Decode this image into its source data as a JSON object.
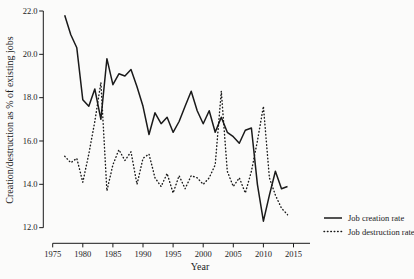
{
  "figure": {
    "background": "#fbfbfa",
    "line_color": "#1a1a1a"
  },
  "chart_data": {
    "type": "line",
    "title": "",
    "xlabel": "Year",
    "ylabel": "Creation/destruction as % of existing jobs",
    "xlim": [
      1975,
      2016
    ],
    "ylim": [
      12.0,
      22.0
    ],
    "grid": "off",
    "legend_position": "lower-right",
    "x_ticks": [
      1975,
      1980,
      1985,
      1990,
      1995,
      2000,
      2005,
      2010,
      2015
    ],
    "x_tick_labels": [
      "1975",
      "1980",
      "1985",
      "1990",
      "1995",
      "2000",
      "2005",
      "2010",
      "2015"
    ],
    "y_ticks": [
      12.0,
      14.0,
      16.0,
      18.0,
      20.0,
      22.0
    ],
    "y_tick_labels": [
      "12.0",
      "14.0",
      "16.0",
      "18.0",
      "20.0",
      "22.0"
    ],
    "x": [
      1977,
      1978,
      1979,
      1980,
      1981,
      1982,
      1983,
      1984,
      1985,
      1986,
      1987,
      1988,
      1989,
      1990,
      1991,
      1992,
      1993,
      1994,
      1995,
      1996,
      1997,
      1998,
      1999,
      2000,
      2001,
      2002,
      2003,
      2004,
      2005,
      2006,
      2007,
      2008,
      2009,
      2010,
      2011,
      2012,
      2013,
      2014
    ],
    "series": [
      {
        "name": "Job creation rate",
        "style": "solid",
        "values": [
          21.8,
          20.9,
          20.3,
          17.9,
          17.6,
          18.4,
          17.0,
          19.8,
          18.6,
          19.1,
          19.0,
          19.3,
          18.5,
          17.6,
          16.3,
          17.3,
          16.8,
          17.1,
          16.4,
          16.9,
          17.6,
          18.3,
          17.4,
          16.8,
          17.4,
          16.4,
          17.1,
          16.4,
          16.2,
          15.9,
          16.5,
          16.6,
          14.0,
          12.3,
          13.5,
          14.6,
          13.8,
          13.9
        ]
      },
      {
        "name": "Job destruction rate",
        "style": "dotted",
        "values": [
          15.3,
          15.0,
          15.2,
          14.1,
          15.4,
          16.9,
          18.7,
          13.7,
          14.9,
          15.6,
          15.1,
          15.5,
          14.0,
          15.2,
          15.4,
          14.3,
          13.9,
          14.5,
          13.6,
          14.4,
          13.8,
          14.4,
          14.3,
          14.0,
          14.3,
          14.9,
          18.3,
          14.6,
          13.9,
          14.3,
          13.6,
          14.6,
          16.0,
          17.6,
          14.3,
          13.5,
          12.9,
          12.6
        ]
      }
    ]
  }
}
